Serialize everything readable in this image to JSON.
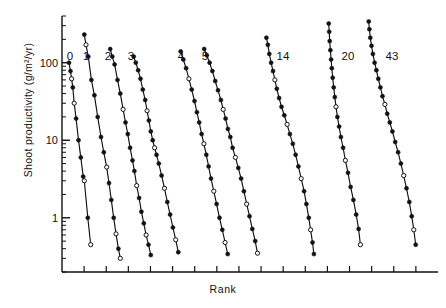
{
  "figure": {
    "xlabel": "Rank",
    "ylabel": "Shoot productivity (g/m2/yr)",
    "ylabel_display": "Shoot productivity (g/m²/yr)"
  },
  "axes": {
    "y_ticks": [
      {
        "label": "100",
        "value": 100
      },
      {
        "label": "10",
        "value": 10
      },
      {
        "label": "1",
        "value": 1
      }
    ],
    "x_tick_count": 16,
    "x_tick_labels": []
  },
  "chart_data": {
    "type": "line",
    "title": "",
    "xlabel": "Rank",
    "ylabel": "Shoot productivity (g/m²/yr)",
    "yscale": "log",
    "ylim": [
      0.2,
      400
    ],
    "xlim": [
      0,
      16
    ],
    "grid": false,
    "legend": "none",
    "marker_styles": [
      "filled-circle",
      "open-circle"
    ],
    "group_labels": [
      "0",
      "1",
      "2",
      "3",
      "4",
      "5",
      "14",
      "20",
      "43"
    ],
    "group_label_x": [
      70,
      86,
      108,
      131,
      181,
      205,
      283,
      348,
      392
    ],
    "group_label_y": 50,
    "series": [
      {
        "name": "0",
        "label": "0",
        "x_start": 0.3,
        "values": [
          100,
          78,
          62,
          48,
          30,
          19,
          10,
          6.0,
          3.4,
          3.0,
          1.0,
          0.45
        ],
        "x": [
          0.3,
          0.36,
          0.41,
          0.46,
          0.52,
          0.6,
          0.7,
          0.8,
          0.9,
          0.95,
          1.1,
          1.22
        ],
        "open_indices": [
          2,
          4,
          9,
          11
        ]
      },
      {
        "name": "1",
        "label": "1",
        "values": [
          230,
          170,
          120,
          60,
          38,
          20,
          11,
          7.0,
          4.5,
          2.8,
          1.7,
          1.0,
          0.62,
          0.4,
          0.3
        ],
        "x": [
          0.95,
          1.02,
          1.12,
          1.25,
          1.38,
          1.52,
          1.66,
          1.78,
          1.9,
          2.0,
          2.1,
          2.2,
          2.3,
          2.4,
          2.48
        ],
        "open_indices": [
          1,
          8,
          12,
          14
        ]
      },
      {
        "name": "2",
        "label": "2",
        "values": [
          150,
          120,
          95,
          60,
          40,
          25,
          17,
          12,
          8.0,
          5.5,
          4.0,
          2.6,
          1.8,
          1.2,
          0.85,
          0.6,
          0.45,
          0.33
        ],
        "x": [
          2.05,
          2.14,
          2.24,
          2.36,
          2.48,
          2.6,
          2.7,
          2.8,
          2.9,
          3.0,
          3.08,
          3.18,
          3.28,
          3.38,
          3.48,
          3.58,
          3.68,
          3.78
        ],
        "open_indices": [
          5,
          11,
          15
        ]
      },
      {
        "name": "3",
        "label": "3",
        "values": [
          120,
          100,
          80,
          62,
          45,
          33,
          24,
          18,
          13,
          10,
          8.0,
          6.5,
          5.0,
          3.5,
          2.4,
          1.6,
          1.1,
          0.75,
          0.52,
          0.36
        ],
        "x": [
          3.05,
          3.14,
          3.24,
          3.34,
          3.44,
          3.54,
          3.62,
          3.7,
          3.78,
          3.86,
          3.94,
          4.02,
          4.12,
          4.24,
          4.36,
          4.48,
          4.6,
          4.72,
          4.84,
          4.95
        ],
        "open_indices": [
          6,
          10,
          14,
          18
        ]
      },
      {
        "name": "4",
        "label": "4",
        "values": [
          140,
          110,
          85,
          62,
          45,
          32,
          23,
          17,
          12,
          9.0,
          6.5,
          4.6,
          3.2,
          2.2,
          1.5,
          1.0,
          0.7,
          0.48,
          0.34
        ],
        "x": [
          5.05,
          5.16,
          5.28,
          5.4,
          5.52,
          5.64,
          5.74,
          5.84,
          5.94,
          6.04,
          6.14,
          6.24,
          6.34,
          6.46,
          6.58,
          6.7,
          6.82,
          6.94,
          7.05
        ],
        "open_indices": [
          3,
          9,
          13,
          17
        ]
      },
      {
        "name": "5",
        "label": "5",
        "values": [
          150,
          125,
          100,
          78,
          58,
          44,
          33,
          25,
          19,
          14,
          11,
          8.0,
          6.0,
          4.4,
          3.2,
          2.2,
          1.5,
          1.05,
          0.72,
          0.5,
          0.35
        ],
        "x": [
          6.05,
          6.16,
          6.28,
          6.4,
          6.52,
          6.64,
          6.76,
          6.86,
          6.96,
          7.06,
          7.16,
          7.26,
          7.38,
          7.5,
          7.62,
          7.74,
          7.86,
          7.98,
          8.1,
          8.22,
          8.32
        ],
        "open_indices": [
          7,
          12,
          16,
          20
        ]
      },
      {
        "name": "14",
        "label": "14",
        "values": [
          210,
          170,
          130,
          100,
          78,
          60,
          46,
          35,
          27,
          21,
          16,
          12,
          9.0,
          6.5,
          4.6,
          3.2,
          2.2,
          1.5,
          1.0,
          0.7,
          0.48,
          0.34
        ],
        "x": [
          8.7,
          8.76,
          8.82,
          8.9,
          8.98,
          9.06,
          9.14,
          9.24,
          9.34,
          9.46,
          9.58,
          9.7,
          9.82,
          9.94,
          10.06,
          10.18,
          10.3,
          10.4,
          10.5,
          10.58,
          10.66,
          10.72
        ],
        "open_indices": [
          5,
          10,
          15,
          19
        ]
      },
      {
        "name": "20",
        "label": "20",
        "values": [
          320,
          250,
          190,
          145,
          110,
          85,
          64,
          48,
          36,
          27,
          20,
          15,
          11,
          8.0,
          5.5,
          3.8,
          2.5,
          1.7,
          1.1,
          0.72,
          0.45
        ],
        "x": [
          11.35,
          11.37,
          11.39,
          11.42,
          11.45,
          11.48,
          11.52,
          11.56,
          11.61,
          11.66,
          11.72,
          11.79,
          11.87,
          11.96,
          12.06,
          12.17,
          12.28,
          12.4,
          12.52,
          12.62,
          12.7
        ],
        "open_indices": [
          9,
          14,
          20
        ]
      },
      {
        "name": "43",
        "label": "43",
        "values": [
          340,
          270,
          210,
          165,
          130,
          100,
          80,
          62,
          48,
          37,
          29,
          22,
          17,
          13,
          9.5,
          7.0,
          5.0,
          3.5,
          2.4,
          1.6,
          1.05,
          0.7,
          0.45
        ],
        "x": [
          13.05,
          13.08,
          13.12,
          13.17,
          13.23,
          13.3,
          13.38,
          13.46,
          13.55,
          13.64,
          13.74,
          13.84,
          13.95,
          14.06,
          14.18,
          14.3,
          14.42,
          14.54,
          14.66,
          14.78,
          14.88,
          14.97,
          15.05
        ],
        "open_indices": [
          10,
          17,
          21
        ]
      }
    ]
  }
}
